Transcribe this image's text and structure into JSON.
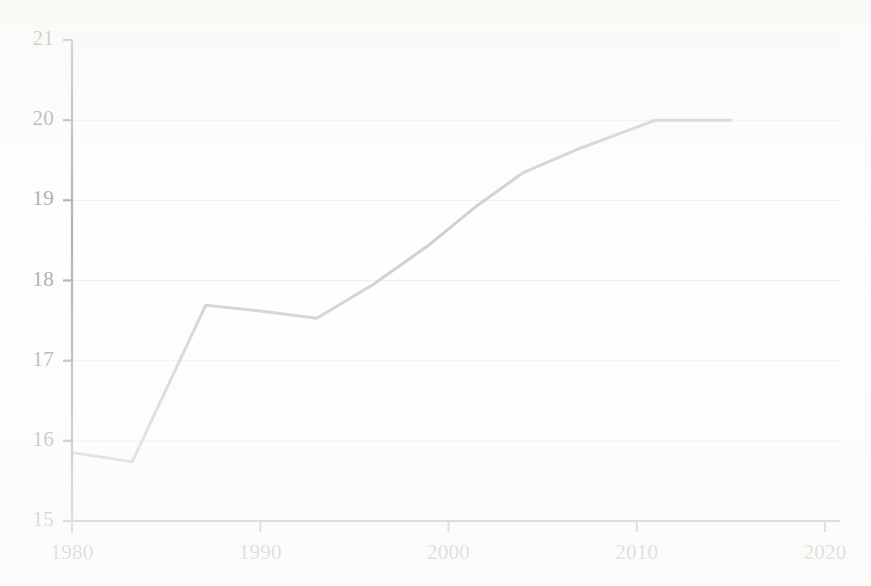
{
  "chart_data": {
    "type": "line",
    "title": "",
    "subtitle": "",
    "xlabel": "",
    "ylabel": "",
    "xlim": [
      1980,
      2020
    ],
    "ylim": [
      15,
      21
    ],
    "grid": true,
    "grid_axis": "y",
    "legend": false,
    "legend_position": "none",
    "x_ticks": [
      1980,
      1990,
      2000,
      2010,
      2020
    ],
    "x_tick_labels": [
      "1980",
      "1990",
      "2000",
      "2010",
      "2020"
    ],
    "y_ticks": [
      15,
      16,
      17,
      18,
      19,
      20,
      21
    ],
    "y_tick_labels": [
      "15",
      "16",
      "17",
      "18",
      "19",
      "20",
      "21"
    ],
    "series": [
      {
        "name": "value",
        "color": "#7d7d7d",
        "line_width": 3,
        "x": [
          1980.1,
          1983.2,
          1987.1,
          1990.0,
          1993.0,
          1996.0,
          1999.0,
          2001.5,
          2004.0,
          2007.0,
          2011.0,
          2013.0,
          2015.0
        ],
        "values": [
          15.85,
          15.74,
          17.69,
          17.62,
          17.53,
          17.95,
          18.45,
          18.93,
          19.35,
          19.65,
          20.0,
          20.0,
          20.0
        ]
      }
    ],
    "annotations": [],
    "colors": {
      "line": "#7d7d7d",
      "axis": "#3a3a3a",
      "gridline": "#c9c9c9",
      "tick_text": "#1c1c1c",
      "background": "#fdfdfc"
    }
  },
  "axes": {
    "y_axis_name": "value-axis",
    "x_axis_name": "year-axis"
  }
}
